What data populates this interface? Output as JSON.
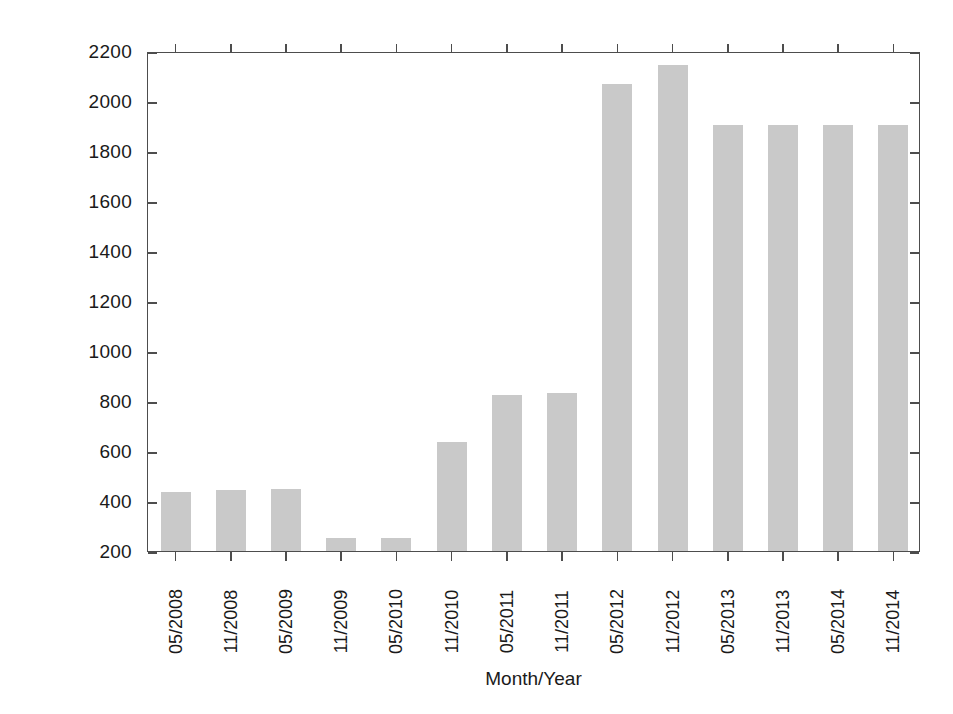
{
  "chart_data": {
    "type": "bar",
    "title": "",
    "xlabel": "Month/Year",
    "ylabel": "Performance/power consumption [Mflop/s / Watt]",
    "categories": [
      "05/2008",
      "11/2008",
      "05/2009",
      "11/2009",
      "05/2010",
      "11/2010",
      "05/2011",
      "11/2011",
      "05/2012",
      "11/2012",
      "05/2013",
      "11/2013",
      "05/2014",
      "11/2014"
    ],
    "values": [
      437,
      444,
      448,
      253,
      253,
      636,
      825,
      832,
      2069,
      2143,
      1905,
      1905,
      1905,
      1905
    ],
    "ylim": [
      200,
      2200
    ],
    "yticks": [
      200,
      400,
      600,
      800,
      1000,
      1200,
      1400,
      1600,
      1800,
      2000,
      2200
    ],
    "ytick_labels": [
      "200",
      "400",
      "600",
      "800",
      "1000",
      "1200",
      "1400",
      "1600",
      "1800",
      "2000",
      "2200"
    ],
    "grid": false,
    "legend": null,
    "bar_color": "#c9c9c9",
    "axis_color": "#4d4d4d"
  }
}
